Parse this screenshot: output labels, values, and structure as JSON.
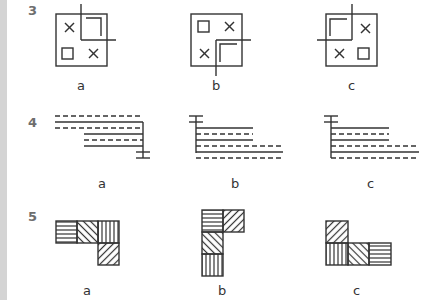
{
  "questions": [
    {
      "number": "3",
      "options": [
        {
          "label": "a",
          "figure": "square with X top-left, small square bottom-left, X bottom-right, corner bracket top-right with crosshair lines at its inner corner"
        },
        {
          "label": "b",
          "figure": "square with small square top-left, X top-right, X bottom-left, corner bracket bottom-right with crosshair lines"
        },
        {
          "label": "c",
          "figure": "square with corner bracket top-left with crosshair lines, X top-right, X bottom-left, small square bottom-right"
        }
      ]
    },
    {
      "number": "4",
      "options": [
        {
          "label": "a",
          "figure": "alternating dashed and solid horizontal lines stepped right, vertical line on right ending in T-cap at bottom"
        },
        {
          "label": "b",
          "figure": "alternating solid and dashed horizontal lines stepped longer at bottom, vertical line on left with T-cap at top"
        },
        {
          "label": "c",
          "figure": "alternating solid and dashed horizontal lines stepped longer at bottom, vertical line on left with T-cap at top"
        }
      ]
    },
    {
      "number": "5",
      "options": [
        {
          "label": "a",
          "figure": "L-shape: horizontal-hatched, back-diagonal, vertical-hatched tiles in a row, forward-diagonal tile below the right"
        },
        {
          "label": "b",
          "figure": "L-shape: horizontal-hatched tile with forward-diagonal tile to its right, back-diagonal then vertical-hatched tiles below"
        },
        {
          "label": "c",
          "figure": "L-shape: forward-diagonal tile on top-left, vertical, back-diagonal, horizontal-hatched tiles in bottom row"
        }
      ]
    }
  ],
  "colors": {
    "line": "#333333",
    "number": "#6e6e6e",
    "sidebar": "#d4d4d4"
  }
}
